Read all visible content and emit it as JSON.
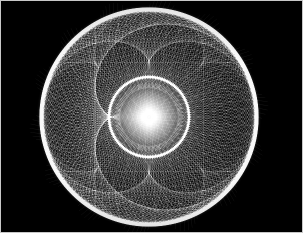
{
  "image": {
    "title": "Spirograph moire interference pattern",
    "kind": "generative-line-art",
    "width": 303,
    "height": 233,
    "background_color": "#000000",
    "line_color": "#ffffff",
    "frame_color": "#c8c8c8",
    "frame_width_px": 1
  },
  "pattern": {
    "type": "envelope-of-chords",
    "description": "Two counter-rotating families of thin white circular arcs radiating from a bright central core, crossing to form a dense moire lattice with bright caustic rings.",
    "center_x": 149,
    "center_y": 117,
    "core": {
      "name": "bright-center-core",
      "center_x": 149,
      "center_y": 117,
      "radius_px": 13,
      "color": "#ffffff"
    },
    "rings": [
      {
        "name": "inner-caustic-ring",
        "radius_px": 40,
        "brightness": 0.85
      },
      {
        "name": "outer-caustic-ring",
        "radius_px": 107,
        "brightness": 1.0
      }
    ],
    "arc_families": [
      {
        "name": "clockwise-family",
        "direction": "cw",
        "count": 150,
        "opacity": 0.42
      },
      {
        "name": "counter-clockwise-family",
        "direction": "ccw",
        "count": 150,
        "opacity": 0.42
      }
    ],
    "line_width_px": 0.5,
    "radial_spokes": 150,
    "max_radius_px": 200
  },
  "colors": {
    "background": "#000000",
    "lines": "#ffffff",
    "frame": "#c8c8c8",
    "page": "#d9d9d9"
  }
}
